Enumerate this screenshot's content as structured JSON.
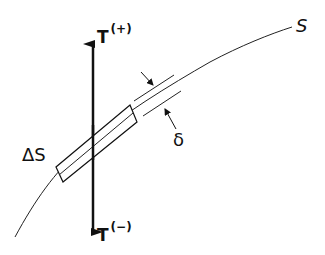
{
  "diagram": {
    "labels": {
      "t_plus": {
        "main": "T",
        "sup": "(+)"
      },
      "t_minus": {
        "main": "T",
        "sup": "(−)"
      },
      "delta_s": "ΔS",
      "s": "S",
      "delta": "δ"
    },
    "colors": {
      "ink": "#111111",
      "background": "#ffffff"
    }
  }
}
